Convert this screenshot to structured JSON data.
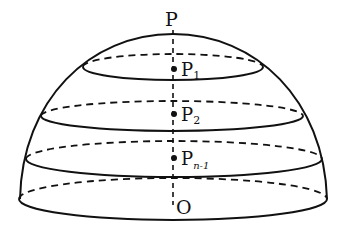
{
  "diagram": {
    "labels": {
      "top": "P",
      "p1": "P",
      "p1_sub": "1",
      "p2": "P",
      "p2_sub": "2",
      "pn1": "P",
      "pn1_sub": "n-1",
      "origin": "O"
    },
    "points": [
      {
        "name": "P1",
        "x": 174,
        "y": 69
      },
      {
        "name": "P2",
        "x": 174,
        "y": 114
      },
      {
        "name": "Pn-1",
        "x": 174,
        "y": 158
      }
    ],
    "cross_sections": [
      {
        "cx": 173,
        "cy": 67,
        "rx": 90,
        "ry": 13
      },
      {
        "cx": 172,
        "cy": 116,
        "rx": 131,
        "ry": 15
      },
      {
        "cx": 174,
        "cy": 159,
        "rx": 148,
        "ry": 18
      },
      {
        "cx": 173,
        "cy": 199,
        "rx": 154,
        "ry": 21
      }
    ],
    "colors": {
      "stroke": "#111111",
      "background": "#ffffff"
    }
  }
}
